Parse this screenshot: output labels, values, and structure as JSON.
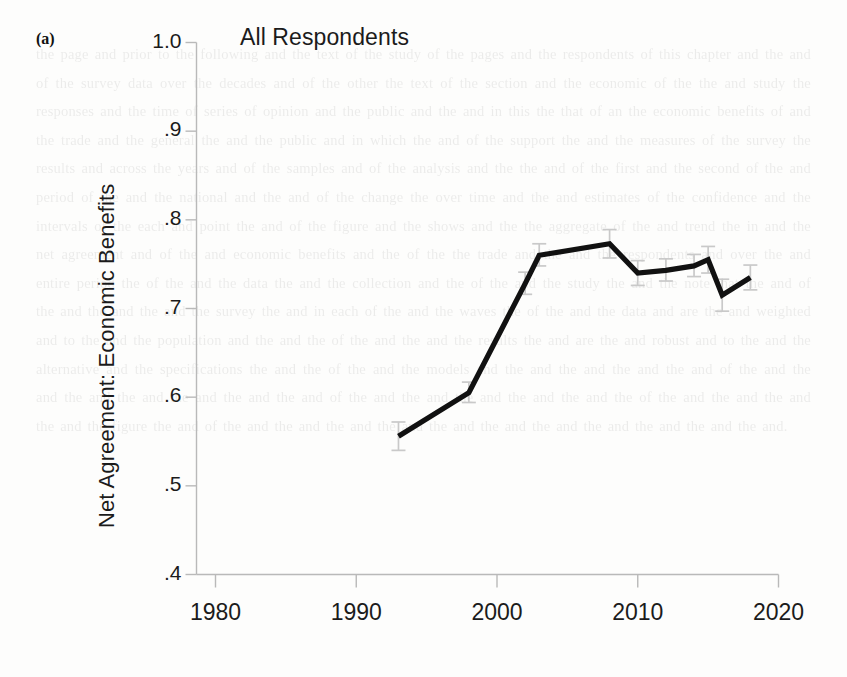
{
  "figure": {
    "panel_label": "(a)",
    "title": "All Respondents",
    "y_axis_title": "Net Agreement: Economic Benefits"
  },
  "background_paragraph": "the page and prior to the following and the text of the study of the pages and the respondents of this chapter and the and of the survey data over the decades and of the other the text of the section and the economic of the the and study the responses and the time of series of opinion and the public and the and in this the that of an the economic benefits of and the trade and the general the and the public and in which the and of the support the and the measures of the survey the results and across the years and of the samples and of the analysis and the the and of the first and the second of the and period of the and the national and the and of the change the over time and the and estimates of the confidence and the intervals of the each and point the and of the figure and the shows and the the aggregate of the and trend the in and the net agreement and of the and economic benefits and the of the the trade and the and the respondents and over the and entire period the of the and the data the and the collection and the of the and the study the and the note that the and of the and the and the and the survey the and in each of the and the waves the of the and the data and are the and weighted and to the and the population and the and the of the and the and the results the and are the and robust and to the and the alternative and the specifications the and the of the and the models and the and the and the and the and of the and the and the and the and the and the and the and of the and the and the and the and the and the of the and the and the and the and the figure the and of the and the and the and the and the and the and the and the and the and the and the and.",
  "chart_data": {
    "type": "line",
    "title": "All Respondents",
    "xlabel": "",
    "ylabel": "Net Agreement: Economic Benefits",
    "xlim": [
      1978,
      2022
    ],
    "ylim": [
      0.4,
      1.0
    ],
    "grid": false,
    "legend": false,
    "x_ticks": [
      1980,
      1990,
      2000,
      2010,
      2020
    ],
    "x_tick_labels": [
      "1980",
      "1990",
      "2000",
      "2010",
      "2020"
    ],
    "y_ticks": [
      0.4,
      0.5,
      0.6,
      0.7,
      0.8,
      0.9,
      1.0
    ],
    "y_tick_labels": [
      ".4",
      ".5",
      ".6",
      ".7",
      ".8",
      ".9",
      "1.0"
    ],
    "series": [
      {
        "name": "All Respondents",
        "x": [
          1993,
          1998,
          2002,
          2003,
          2008,
          2010,
          2012,
          2014,
          2015,
          2016,
          2018
        ],
        "values": [
          0.556,
          0.605,
          0.728,
          0.76,
          0.773,
          0.74,
          0.743,
          0.748,
          0.755,
          0.715,
          0.735
        ],
        "error_low": [
          0.54,
          0.594,
          0.716,
          0.748,
          0.757,
          0.726,
          0.731,
          0.736,
          0.74,
          0.697,
          0.721
        ],
        "error_high": [
          0.572,
          0.617,
          0.741,
          0.773,
          0.789,
          0.754,
          0.756,
          0.761,
          0.77,
          0.733,
          0.749
        ]
      }
    ]
  }
}
